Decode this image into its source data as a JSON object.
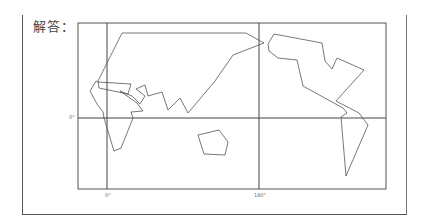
{
  "answer": {
    "label": "解答："
  },
  "map": {
    "equator_label": "0°",
    "meridian_labels": [
      "0°",
      "180°"
    ],
    "stroke_color": "#555555",
    "regions": [
      {
        "name": "eurasia-africa",
        "points": "122,33 246,33 264,43 233,55 215,81 188,113 180,98 168,110 162,92 148,96 145,85 136,89 145,96 140,104 132,96 120,91 137,103 143,111 131,112 133,118 121,148 114,151 104,118 103,112 97,104 90,91 96,81 98,82 131,84 128,94 99,88 98,81"
      },
      {
        "name": "americas",
        "points": "274,34 322,43 325,61 332,69 337,58 364,70 336,101 359,113 368,125 346,176 341,117 347,113 343,108 303,86 297,60 278,58 269,51 268,44"
      },
      {
        "name": "australia",
        "points": "198,135 219,130 228,142 225,155 204,154"
      }
    ]
  },
  "chart_data": {
    "type": "diagram",
    "title": "解答：",
    "grid": {
      "equator": "0°",
      "meridians": [
        "0°",
        "180°"
      ]
    },
    "shapes": [
      "Eurasia-Africa polygon",
      "Americas polygon",
      "Australia polygon"
    ]
  }
}
